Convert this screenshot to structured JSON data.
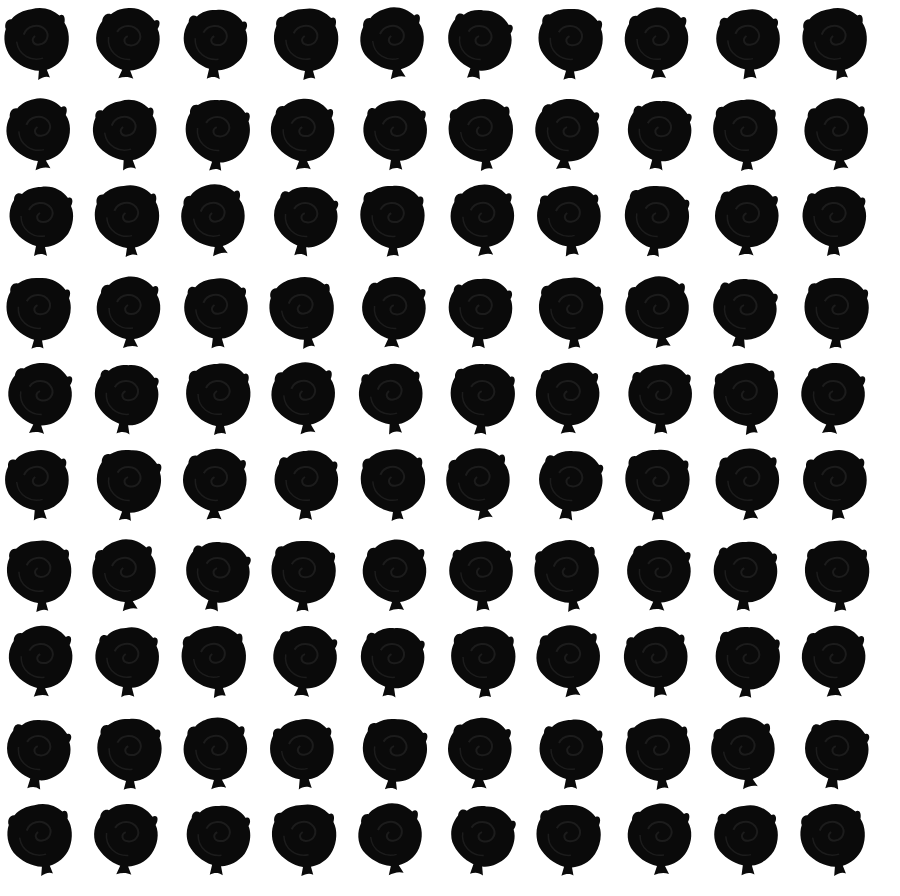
{
  "pattern": {
    "name": "Black rose silhouette grid",
    "rows": 10,
    "columns": 10,
    "motif": "rose-silhouette",
    "colors": {
      "background": "#ffffff",
      "motif": "#0a0a0a",
      "motif_shade": "#1c1c1c"
    }
  }
}
